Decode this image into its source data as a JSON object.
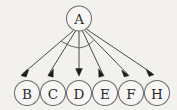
{
  "diagram": {
    "type": "directed-star-graph",
    "title": "",
    "background_color": "#f2f1ee",
    "edge_color": "#4a4a4a",
    "node_stroke_color": "#6b6b6b",
    "node_fill_color": "#f7f6f4",
    "label_color": "#2a2a2a",
    "arrowhead_color": "#1c1c1c",
    "root": {
      "id": "A",
      "label": "A",
      "cx": 79,
      "cy": 18.5,
      "r": 12.5
    },
    "leaves": [
      {
        "id": "B",
        "label": "B",
        "cx": 27,
        "cy": 93,
        "r": 12.5
      },
      {
        "id": "C",
        "label": "C",
        "cx": 53,
        "cy": 93,
        "r": 12.5
      },
      {
        "id": "D",
        "label": "D",
        "cx": 79,
        "cy": 93,
        "r": 12.5
      },
      {
        "id": "E",
        "label": "E",
        "cx": 105,
        "cy": 93,
        "r": 12.5
      },
      {
        "id": "F",
        "label": "F",
        "cx": 131,
        "cy": 93,
        "r": 12.5
      },
      {
        "id": "H",
        "label": "H",
        "cx": 157,
        "cy": 93,
        "r": 12.5
      }
    ],
    "edges": [
      {
        "from": "A",
        "to": "B",
        "directed": true
      },
      {
        "from": "A",
        "to": "C",
        "directed": true
      },
      {
        "from": "A",
        "to": "D",
        "directed": true
      },
      {
        "from": "A",
        "to": "E",
        "directed": true
      },
      {
        "from": "A",
        "to": "F",
        "directed": true
      },
      {
        "from": "A",
        "to": "H",
        "directed": true
      }
    ],
    "angle_marks": [
      {
        "id": "arc-left",
        "between": [
          "A-B",
          "A-D"
        ],
        "path": "M 61.5 41.5 Q 70 47 79 48"
      },
      {
        "id": "arc-right",
        "between": [
          "A-D",
          "A-E"
        ],
        "path": "M 79 48 Q 87.5 47 93.5 40.5"
      }
    ]
  }
}
